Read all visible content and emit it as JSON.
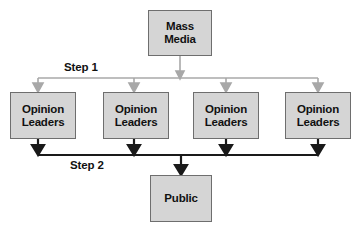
{
  "diagram": {
    "background_color": "#ffffff",
    "node_fill_color": "#d5d5d5",
    "node_border_color": "#6e6e6e",
    "text_color": "#111111",
    "step1_arrow_color": "#a8a8a8",
    "step2_arrow_color": "#1a1a1a",
    "source": {
      "id": "mass-media",
      "line1": "Mass",
      "line2": "Media",
      "x": 148,
      "y": 10,
      "w": 64,
      "h": 46
    },
    "step1": {
      "label": "Step 1",
      "label_x": 62,
      "label_y": 61
    },
    "step2": {
      "label": "Step 2",
      "label_x": 68,
      "label_y": 159
    },
    "middle": [
      {
        "id": "opinion-leaders-1",
        "line1": "Opinion",
        "line2": "Leaders",
        "x": 10,
        "y": 92,
        "w": 66,
        "h": 47
      },
      {
        "id": "opinion-leaders-2",
        "line1": "Opinion",
        "line2": "Leaders",
        "x": 103,
        "y": 92,
        "w": 66,
        "h": 47
      },
      {
        "id": "opinion-leaders-3",
        "line1": "Opinion",
        "line2": "Leaders",
        "x": 193,
        "y": 92,
        "w": 66,
        "h": 47
      },
      {
        "id": "opinion-leaders-4",
        "line1": "Opinion",
        "line2": "Leaders",
        "x": 285,
        "y": 92,
        "w": 66,
        "h": 47
      }
    ],
    "target": {
      "id": "public",
      "line1": "Public",
      "line2": "",
      "x": 150,
      "y": 175,
      "w": 62,
      "h": 47
    }
  }
}
